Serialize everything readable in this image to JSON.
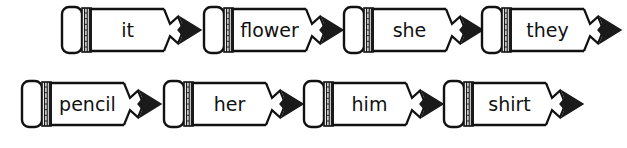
{
  "worksheet": {
    "title": "Pencil word cards",
    "description": "Eight pencil-shaped word cards arranged in two rows of four",
    "ink_color": "#111111",
    "paper_color": "#ffffff",
    "graphite_tip_color": "#1a1a1a",
    "ferrule_color": "#e8e8e8",
    "rows": [
      {
        "name": "top-row",
        "cards": [
          {
            "word": "it",
            "left": 58,
            "font_size": 19
          },
          {
            "word": "flower",
            "left": 200,
            "font_size": 19
          },
          {
            "word": "she",
            "left": 340,
            "font_size": 19
          },
          {
            "word": "they",
            "left": 478,
            "font_size": 19
          }
        ]
      },
      {
        "name": "bottom-row",
        "cards": [
          {
            "word": "pencil",
            "left": 18,
            "font_size": 19
          },
          {
            "word": "her",
            "left": 160,
            "font_size": 19
          },
          {
            "word": "him",
            "left": 300,
            "font_size": 19
          },
          {
            "word": "shirt",
            "left": 440,
            "font_size": 19
          }
        ]
      }
    ]
  }
}
